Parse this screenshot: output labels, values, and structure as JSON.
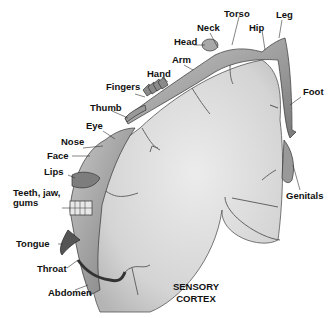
{
  "title_lines": [
    "SENSORY",
    "CORTEX"
  ],
  "labels": {
    "torso": "Torso",
    "leg": "Leg",
    "neck": "Neck",
    "hip": "Hip",
    "head": "Head",
    "arm": "Arm",
    "hand": "Hand",
    "fingers": "Fingers",
    "foot": "Foot",
    "thumb": "Thumb",
    "eye": "Eye",
    "nose": "Nose",
    "face": "Face",
    "lips": "Lips",
    "teeth_line1": "Teeth, jaw,",
    "teeth_line2": "gums",
    "genitals": "Genitals",
    "tongue": "Tongue",
    "throat": "Throat",
    "abdomen": "Abdomen"
  }
}
